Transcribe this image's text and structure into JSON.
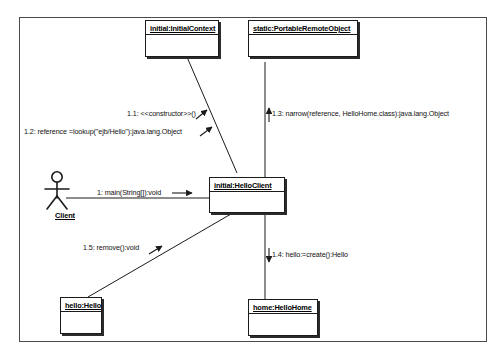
{
  "diagram": {
    "type": "uml-collaboration-diagram",
    "frame": {
      "label": ""
    },
    "actor": {
      "name": "Client",
      "icon": "actor-stick-figure"
    },
    "objects": [
      {
        "id": "initial-context",
        "label": "initial:InitialContext"
      },
      {
        "id": "portable-remote-object",
        "label": "static:PortableRemoteObject"
      },
      {
        "id": "hello-client",
        "label": "initial:HelloClient"
      },
      {
        "id": "hello",
        "label": "hello:Hello"
      },
      {
        "id": "hello-home",
        "label": "home:HelloHome"
      }
    ],
    "messages": [
      {
        "id": "m1",
        "label": "1: main(String[]):void"
      },
      {
        "id": "m11",
        "label": "1.1: <<constructor>>()"
      },
      {
        "id": "m12",
        "label": "1.2: reference =lookup(\"ejb/Hello\"):java.lang.Object"
      },
      {
        "id": "m13",
        "label": "1.3: narrow(reference, HelloHome.class):java.lang.Object"
      },
      {
        "id": "m14",
        "label": "1.4: hello:=create():Hello"
      },
      {
        "id": "m15",
        "label": "1.5: remove():void"
      }
    ],
    "colors": {
      "line": "#1b1b1b",
      "frame": "#4a4a4a",
      "text": "#111111",
      "background": "#ffffff"
    }
  }
}
